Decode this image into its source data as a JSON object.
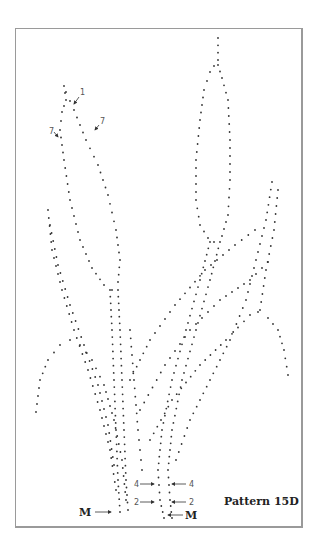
{
  "pattern": {
    "title": "Pattern 15D",
    "labels": {
      "one": "1",
      "seven_left": "7",
      "seven_right": "7",
      "four_left": "4",
      "four_right": "4",
      "two_left": "2",
      "two_right": "2",
      "m_left": "M",
      "m_right": "M"
    }
  },
  "colors": {
    "border": "#9a9a9a",
    "dot": "#333333",
    "label": "#555555"
  }
}
